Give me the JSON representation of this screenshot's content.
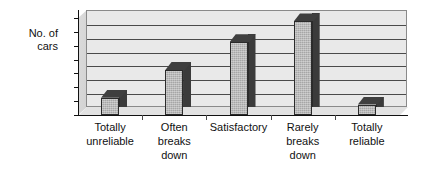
{
  "chart_data": {
    "type": "bar",
    "title": "",
    "subtitle": "",
    "xlabel": "",
    "ylabel": "No. of cars",
    "ylabel_lines": [
      "No. of",
      "cars"
    ],
    "categories": [
      "Totally unreliable",
      "Often breaks down",
      "Satisfactory",
      "Rarely breaks down",
      "Totally reliable"
    ],
    "category_lines": [
      [
        "Totally",
        "unreliable"
      ],
      [
        "Often",
        "breaks",
        "down"
      ],
      [
        "Satisfactory"
      ],
      [
        "Rarely",
        "breaks",
        "down"
      ],
      [
        "Totally",
        "reliable"
      ]
    ],
    "values": [
      2.5,
      6.5,
      10.5,
      13.5,
      1.5
    ],
    "ylim": [
      0,
      14
    ],
    "ytick_labels": [
      "0",
      "2",
      "4",
      "6",
      "8",
      "10",
      "12",
      "14"
    ],
    "ytick_values": [
      0,
      2,
      4,
      6,
      8,
      10,
      12,
      14
    ],
    "grid": true,
    "grid_orientation": "horizontal",
    "legend": false,
    "legend_position": "none",
    "style": "3d-column",
    "colors": {
      "bar_front": "#a6a6a6",
      "bar_side": "#3b3b3b",
      "bar_top": "#3f3f3f",
      "bar_outline": "#2b2b2b",
      "plot_background": "#e9e9e9",
      "gridline": "#4a4a4a",
      "axis": "#111111",
      "floor": "#e2e2e2",
      "side_wall": "#d8d8d8",
      "page_background": "#ffffff",
      "text": "#111111"
    }
  }
}
